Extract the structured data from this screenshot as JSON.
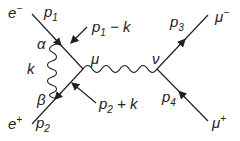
{
  "diagram": {
    "type": "feynman-diagram",
    "process": "e- e+ -> mu- mu+ with initial-state virtual photon correction",
    "particles": {
      "electron": {
        "symbol": "e",
        "charge": "−",
        "momentum": "p",
        "momentum_index": "1"
      },
      "positron": {
        "symbol": "e",
        "charge": "+",
        "momentum": "p",
        "momentum_index": "2"
      },
      "muon_minus": {
        "symbol": "μ",
        "charge": "−",
        "momentum": "p",
        "momentum_index": "3"
      },
      "muon_plus": {
        "symbol": "μ",
        "charge": "+",
        "momentum": "p",
        "momentum_index": "4"
      }
    },
    "internal_momenta": {
      "upper": {
        "p": "p",
        "index": "1",
        "rest": " − k"
      },
      "lower": {
        "p": "p",
        "index": "2",
        "rest": " + k"
      }
    },
    "virtual_photon": {
      "label": "k"
    },
    "vertex_labels": {
      "alpha": "α",
      "beta": "β",
      "mu": "μ",
      "nu": "ν"
    },
    "colors": {
      "ink": "#222222",
      "background": "#ffffff"
    }
  }
}
